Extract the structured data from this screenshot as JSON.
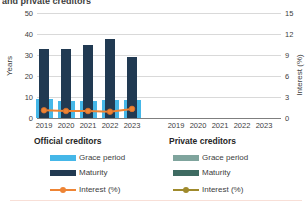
{
  "title_fragment": "and private creditors",
  "chart_data": {
    "type": "bar",
    "categories": [
      "2019",
      "2020",
      "2021",
      "2022",
      "2023"
    ],
    "groups": [
      {
        "label": "Official creditors",
        "series": [
          {
            "name": "Grace period",
            "type": "bar",
            "axis": "left",
            "color": "#45B7E8",
            "values": [
              9,
              8,
              8,
              8.5,
              8.5
            ]
          },
          {
            "name": "Maturity",
            "type": "bar",
            "axis": "left",
            "color": "#213A52",
            "values": [
              33,
              33,
              35,
              37.5,
              29
            ]
          },
          {
            "name": "Interest (%)",
            "type": "line",
            "axis": "right",
            "color": "#EE8434",
            "marker_edge": "#D9702A",
            "values": [
              1.1,
              1.0,
              1.0,
              0.9,
              1.3
            ]
          }
        ]
      },
      {
        "label": "Private creditors",
        "series": [
          {
            "name": "Grace period",
            "type": "bar",
            "axis": "left",
            "color": "#7FA49D",
            "values": [
              null,
              null,
              null,
              null,
              null
            ]
          },
          {
            "name": "Maturity",
            "type": "bar",
            "axis": "left",
            "color": "#3E6B62",
            "values": [
              null,
              null,
              null,
              null,
              null
            ]
          },
          {
            "name": "Interest (%)",
            "type": "line",
            "axis": "right",
            "color": "#9F8A2C",
            "marker_edge": "#8A771F",
            "values": [
              null,
              null,
              null,
              null,
              null
            ]
          }
        ]
      }
    ],
    "left_axis": {
      "label": "Years",
      "min": 0,
      "max": 50,
      "ticks": [
        0,
        10,
        20,
        30,
        40,
        50
      ]
    },
    "right_axis": {
      "label": "Interest (%)",
      "min": 0,
      "max": 15,
      "ticks": [
        0,
        3,
        6,
        9,
        12,
        15
      ]
    },
    "grid": true,
    "legend_position": "bottom",
    "colors": {
      "gridline": "#d9d9d9",
      "axis_line": "#7f7f7f",
      "text": "#404040"
    }
  }
}
